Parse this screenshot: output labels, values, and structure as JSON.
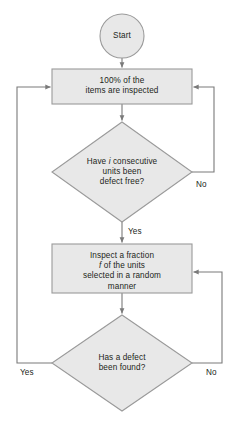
{
  "diagram": {
    "type": "flowchart",
    "title": "",
    "colors": {
      "node_fill": "#e8e8e8",
      "node_stroke": "#9a9a9a",
      "edge_stroke": "#7a7a7a",
      "text": "#231f20",
      "background": "#ffffff"
    },
    "nodes": [
      {
        "id": "start",
        "shape": "circle",
        "label": "Start"
      },
      {
        "id": "box1",
        "shape": "rectangle",
        "label": "100% of the\nitems are inspected"
      },
      {
        "id": "diamond1",
        "shape": "diamond",
        "label_line1_pre": "Have ",
        "label_line1_var": "i",
        "label_line1_post": " consecutive",
        "label_line2": "units been",
        "label_line3": "defect free?"
      },
      {
        "id": "box2",
        "shape": "rectangle",
        "label_line1": "Inspect a fraction",
        "label_line2_var": "f",
        "label_line2_post": " of the units",
        "label_line3": "selected in a random",
        "label_line4": "manner"
      },
      {
        "id": "diamond2",
        "shape": "diamond",
        "label": "Has a defect\nbeen found?"
      }
    ],
    "edges": [
      {
        "id": "e-start-box1",
        "from": "start",
        "to": "box1",
        "label": ""
      },
      {
        "id": "e-box1-d1",
        "from": "box1",
        "to": "diamond1",
        "label": ""
      },
      {
        "id": "e-d1-no",
        "from": "diamond1",
        "to": "box1",
        "label": "No"
      },
      {
        "id": "e-d1-yes",
        "from": "diamond1",
        "to": "box2",
        "label": "Yes"
      },
      {
        "id": "e-box2-d2",
        "from": "box2",
        "to": "diamond2",
        "label": ""
      },
      {
        "id": "e-d2-yes",
        "from": "diamond2",
        "to": "box1",
        "label": "Yes"
      },
      {
        "id": "e-d2-no",
        "from": "diamond2",
        "to": "box2",
        "label": "No"
      }
    ]
  }
}
